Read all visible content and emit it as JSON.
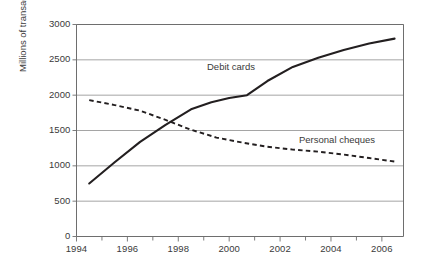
{
  "chart_data": {
    "type": "line",
    "title": "",
    "xlabel": "",
    "ylabel": "Millions of transactions",
    "xlim": [
      1994,
      2006.85
    ],
    "ylim": [
      0,
      3000
    ],
    "grid": "horizontal",
    "legend_position": "inline-annotations",
    "yticks": [
      0,
      500,
      1000,
      1500,
      2000,
      2500,
      3000
    ],
    "ytick_labels": [
      "0",
      "500",
      "1000",
      "1500",
      "2000",
      "2500",
      "3000"
    ],
    "xticks": [
      1994,
      1995,
      1996,
      1997,
      1998,
      1999,
      2000,
      2001,
      2002,
      2003,
      2004,
      2005,
      2006
    ],
    "xtick_labels_major": [
      "1994",
      "1996",
      "1998",
      "2000",
      "2002",
      "2004",
      "2006"
    ],
    "xticks_major": [
      1994,
      1996,
      1998,
      2000,
      2002,
      2004,
      2006
    ],
    "series": [
      {
        "name": "Debit cards",
        "style": "solid",
        "color": "#231f20",
        "x": [
          1994.5,
          1995.5,
          1996.5,
          1997.5,
          1998.5,
          1999.3,
          2000.0,
          2000.7,
          2001.5,
          2002.5,
          2003.5,
          2004.5,
          2005.5,
          2006.5
        ],
        "values": [
          750,
          1050,
          1340,
          1580,
          1800,
          1900,
          1960,
          2000,
          2200,
          2400,
          2530,
          2640,
          2730,
          2800
        ]
      },
      {
        "name": "Personal cheques",
        "style": "dashed",
        "color": "#231f20",
        "x": [
          1994.5,
          1995.5,
          1996.5,
          1997.5,
          1998.5,
          1999.5,
          2000.5,
          2001.5,
          2002.5,
          2003.5,
          2004.5,
          2005.5,
          2006.5
        ],
        "values": [
          1930,
          1860,
          1780,
          1650,
          1510,
          1400,
          1330,
          1270,
          1230,
          1200,
          1160,
          1110,
          1060
        ]
      }
    ],
    "annotations": [
      {
        "text": "Debit cards",
        "x": 2000.2,
        "y": 2280
      },
      {
        "text": "Personal cheques",
        "x": 2003.9,
        "y": 1580
      }
    ]
  }
}
